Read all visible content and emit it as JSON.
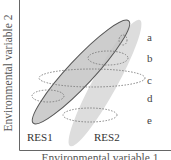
{
  "diagram": {
    "axes": {
      "y_label": "Environmental variable 2",
      "x_label": "Environmental variable 1"
    },
    "resources": [
      {
        "id": "RES1",
        "label": "RES1",
        "fill": "#c8c8c8",
        "stroke": "#555555"
      },
      {
        "id": "RES2",
        "label": "RES2",
        "fill": "#dcdcdc",
        "stroke": "none"
      }
    ],
    "levels": [
      {
        "id": "a",
        "label": "a"
      },
      {
        "id": "b",
        "label": "b"
      },
      {
        "id": "c",
        "label": "c"
      },
      {
        "id": "d",
        "label": "d"
      },
      {
        "id": "e",
        "label": "e"
      }
    ],
    "colors": {
      "axis": "#666666",
      "dashed": "#777777",
      "text": "#444444"
    }
  }
}
